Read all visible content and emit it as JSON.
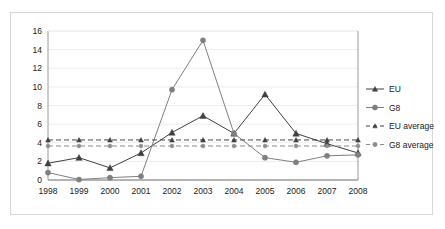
{
  "chart_data": {
    "type": "line",
    "title": "",
    "xlabel": "",
    "ylabel": "",
    "categories": [
      "1998",
      "1999",
      "2000",
      "2001",
      "2002",
      "2003",
      "2004",
      "2005",
      "2006",
      "2007",
      "2008"
    ],
    "ylim": [
      0,
      16
    ],
    "ytick_step": 2,
    "yticks": [
      "0",
      "2",
      "4",
      "6",
      "8",
      "10",
      "12",
      "14",
      "16"
    ],
    "grid": true,
    "grid_axis": "y",
    "legend_position": "right",
    "series": [
      {
        "name": "EU",
        "color": "#404040",
        "marker": "triangle",
        "style": "solid",
        "values": [
          1.8,
          2.4,
          1.3,
          2.9,
          5.1,
          6.9,
          5.0,
          9.2,
          5.0,
          3.9,
          2.9
        ]
      },
      {
        "name": "G8",
        "color": "#7f7f7f",
        "marker": "circle",
        "style": "solid",
        "values": [
          0.8,
          0.05,
          0.25,
          0.4,
          9.7,
          15.0,
          5.0,
          2.4,
          1.9,
          2.6,
          2.7
        ]
      },
      {
        "name": "EU average",
        "color": "#404040",
        "marker": "triangle",
        "style": "dashed",
        "value": 4.3,
        "values": [
          4.3,
          4.3,
          4.3,
          4.3,
          4.3,
          4.3,
          4.3,
          4.3,
          4.3,
          4.3,
          4.3
        ]
      },
      {
        "name": "G8 average",
        "color": "#8c8c8c",
        "marker": "circle",
        "style": "dashed",
        "value": 3.65,
        "values": [
          3.65,
          3.65,
          3.65,
          3.65,
          3.65,
          3.65,
          3.65,
          3.65,
          3.65,
          3.65,
          3.65
        ]
      }
    ]
  },
  "legend": {
    "items": [
      {
        "label": "EU"
      },
      {
        "label": "G8"
      },
      {
        "label": "EU average"
      },
      {
        "label": "G8 average"
      }
    ]
  },
  "axes": {
    "y": {
      "labels": [
        "16",
        "14",
        "12",
        "10",
        "8",
        "6",
        "4",
        "2",
        "0"
      ]
    },
    "x": {
      "labels": [
        "1998",
        "1999",
        "2000",
        "2001",
        "2002",
        "2003",
        "2004",
        "2005",
        "2006",
        "2007",
        "2008"
      ]
    }
  },
  "colors": {
    "eu": "#404040",
    "g8": "#7f7f7f",
    "eu_average": "#404040",
    "g8_average": "#8c8c8c",
    "grid": "#e8eef5",
    "axis": "#9a9a9a",
    "frame": "#d8d8d8",
    "text": "#1a1a1a",
    "background": "#ffffff"
  }
}
